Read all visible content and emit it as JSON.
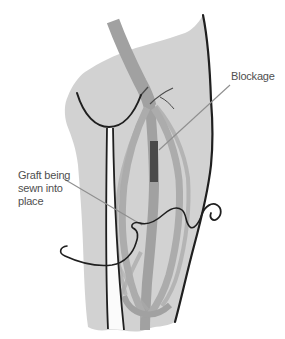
{
  "illustration": {
    "title": "Leg bypass graft surgical illustration",
    "labels": {
      "blockage": "Blockage",
      "graft": "Graft being sewn into place"
    },
    "colors": {
      "background": "#ffffff",
      "leg_fill": "#d2d2d2",
      "vessel": "#a1a1a1",
      "vessel_light": "#acacac",
      "blockage_fill": "#4a4a4a",
      "outline": "#1f1f1f",
      "twig": "#4a4a4a",
      "leader_line": "#8f8f8f",
      "label_text": "#4f4f4f"
    },
    "icons": [
      "suture-needle-icon",
      "suture-thread",
      "blockage-segment"
    ]
  }
}
